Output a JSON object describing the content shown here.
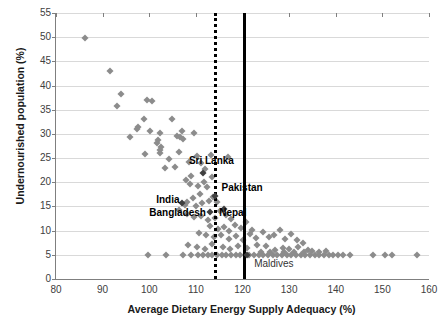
{
  "chart_data": {
    "type": "scatter",
    "title": "",
    "xlabel": "Average Dietary Energy Supply Adequacy (%)",
    "ylabel": "Undernourished population (%)",
    "xlim": [
      80,
      160
    ],
    "ylim": [
      0,
      55
    ],
    "xticks": [
      80,
      90,
      100,
      110,
      120,
      130,
      140,
      150,
      160
    ],
    "yticks": [
      0,
      5,
      10,
      15,
      20,
      25,
      30,
      35,
      40,
      45,
      50,
      55
    ],
    "grid": "horizontal",
    "legend": "none",
    "marker": "diamond",
    "marker_color": "#8c8c8c",
    "highlight_color": "#3f3f3f",
    "reference_lines": [
      {
        "name": "dotted-threshold",
        "x": 113.8,
        "style": "dotted",
        "color": "#000000"
      },
      {
        "name": "solid-threshold",
        "x": 120.2,
        "style": "solid",
        "color": "#000000"
      }
    ],
    "annotations": [
      {
        "label": "Sri Lanka",
        "x": 111.5,
        "y": 22.0,
        "label_x": 108.5,
        "label_y": 24.5
      },
      {
        "label": "Pakistan",
        "x": 114.0,
        "y": 17.2,
        "label_x": 115.5,
        "label_y": 18.8
      },
      {
        "label": "India",
        "x": 107.0,
        "y": 15.8,
        "label_x": 101.5,
        "label_y": 16.4
      },
      {
        "label": "Bangladesh",
        "x": 113.0,
        "y": 13.8,
        "label_x": 100.0,
        "label_y": 13.6
      },
      {
        "label": "Nepal",
        "x": 116.0,
        "y": 14.4,
        "label_x": 115.0,
        "label_y": 13.6
      },
      {
        "label": "Maldives",
        "x": 121.0,
        "y": 5.0,
        "label_x": 122.5,
        "label_y": 3.0
      }
    ],
    "points": [
      [
        86.2,
        49.8
      ],
      [
        91.5,
        43.1
      ],
      [
        94.0,
        38.2
      ],
      [
        93.0,
        35.7
      ],
      [
        99.6,
        37.0
      ],
      [
        100.6,
        36.8
      ],
      [
        97.3,
        31.0
      ],
      [
        97.6,
        31.4
      ],
      [
        98.9,
        33.0
      ],
      [
        95.8,
        29.3
      ],
      [
        100.2,
        30.5
      ],
      [
        102.3,
        30.2
      ],
      [
        104.9,
        33.0
      ],
      [
        101.8,
        28.8
      ],
      [
        101.6,
        28.2
      ],
      [
        102.6,
        27.2
      ],
      [
        102.4,
        26.6
      ],
      [
        102.2,
        26.0
      ],
      [
        99.0,
        25.8
      ],
      [
        106.0,
        29.5
      ],
      [
        106.6,
        29.3
      ],
      [
        107.0,
        30.5
      ],
      [
        107.3,
        29.0
      ],
      [
        109.7,
        30.1
      ],
      [
        106.3,
        26.3
      ],
      [
        104.2,
        24.8
      ],
      [
        103.4,
        23.0
      ],
      [
        105.6,
        23.2
      ],
      [
        108.5,
        24.2
      ],
      [
        110.3,
        25.4
      ],
      [
        111.0,
        24.0
      ],
      [
        112.0,
        22.8
      ],
      [
        113.2,
        25.6
      ],
      [
        116.8,
        25.3
      ],
      [
        109.0,
        21.2
      ],
      [
        107.8,
        20.4
      ],
      [
        108.8,
        19.6
      ],
      [
        110.4,
        19.2
      ],
      [
        111.7,
        20.0
      ],
      [
        112.4,
        19.0
      ],
      [
        113.5,
        21.0
      ],
      [
        110.8,
        17.6
      ],
      [
        109.4,
        16.8
      ],
      [
        108.2,
        16.0
      ],
      [
        107.6,
        15.4
      ],
      [
        110.0,
        15.0
      ],
      [
        111.4,
        15.8
      ],
      [
        112.8,
        16.2
      ],
      [
        113.6,
        17.0
      ],
      [
        114.6,
        16.0
      ],
      [
        106.4,
        14.2
      ],
      [
        108.0,
        13.4
      ],
      [
        109.6,
        12.8
      ],
      [
        111.2,
        13.0
      ],
      [
        112.6,
        12.2
      ],
      [
        114.0,
        12.6
      ],
      [
        115.2,
        14.0
      ],
      [
        116.4,
        13.2
      ],
      [
        117.6,
        12.4
      ],
      [
        113.0,
        11.0
      ],
      [
        114.8,
        10.4
      ],
      [
        116.0,
        10.8
      ],
      [
        117.2,
        10.0
      ],
      [
        118.4,
        11.2
      ],
      [
        119.6,
        10.6
      ],
      [
        120.8,
        11.8
      ],
      [
        122.0,
        10.2
      ],
      [
        110.6,
        9.6
      ],
      [
        112.2,
        9.0
      ],
      [
        113.8,
        8.6
      ],
      [
        115.4,
        9.2
      ],
      [
        117.0,
        8.2
      ],
      [
        118.6,
        8.8
      ],
      [
        120.2,
        8.0
      ],
      [
        121.6,
        9.4
      ],
      [
        123.0,
        8.4
      ],
      [
        124.4,
        9.8
      ],
      [
        125.6,
        8.6
      ],
      [
        126.8,
        9.0
      ],
      [
        128.0,
        10.2
      ],
      [
        129.2,
        8.2
      ],
      [
        130.4,
        9.4
      ],
      [
        131.6,
        8.0
      ],
      [
        133.0,
        7.4
      ],
      [
        108.4,
        7.0
      ],
      [
        110.2,
        6.6
      ],
      [
        112.0,
        6.2
      ],
      [
        113.4,
        7.2
      ],
      [
        103.6,
        5.0
      ],
      [
        99.8,
        5.0
      ],
      [
        107.2,
        5.0
      ],
      [
        109.0,
        5.0
      ],
      [
        110.5,
        5.0
      ],
      [
        111.5,
        5.0
      ],
      [
        112.5,
        5.0
      ],
      [
        113.5,
        5.0
      ],
      [
        114.5,
        5.0
      ],
      [
        115.5,
        5.0
      ],
      [
        116.5,
        5.0
      ],
      [
        117.5,
        5.0
      ],
      [
        118.5,
        5.0
      ],
      [
        119.5,
        5.0
      ],
      [
        120.5,
        5.0
      ],
      [
        121.5,
        5.0
      ],
      [
        122.5,
        5.0
      ],
      [
        123.5,
        5.0
      ],
      [
        124.5,
        5.0
      ],
      [
        125.5,
        5.0
      ],
      [
        126.5,
        5.0
      ],
      [
        127.5,
        5.0
      ],
      [
        128.5,
        5.0
      ],
      [
        129.5,
        5.0
      ],
      [
        130.5,
        5.0
      ],
      [
        131.5,
        5.0
      ],
      [
        132.5,
        5.0
      ],
      [
        133.5,
        5.0
      ],
      [
        134.5,
        5.0
      ],
      [
        135.5,
        5.0
      ],
      [
        136.5,
        5.0
      ],
      [
        137.5,
        5.0
      ],
      [
        138.5,
        5.0
      ],
      [
        139.5,
        5.0
      ],
      [
        140.5,
        5.0
      ],
      [
        141.5,
        5.0
      ],
      [
        143.0,
        5.0
      ],
      [
        148.0,
        5.0
      ],
      [
        150.5,
        5.0
      ],
      [
        152.0,
        5.0
      ],
      [
        157.5,
        5.0
      ],
      [
        127.0,
        6.0
      ],
      [
        128.6,
        6.4
      ],
      [
        130.0,
        6.2
      ],
      [
        132.0,
        6.6
      ],
      [
        134.0,
        6.0
      ],
      [
        125.0,
        6.8
      ],
      [
        123.2,
        7.0
      ],
      [
        121.0,
        6.4
      ],
      [
        119.0,
        6.8
      ],
      [
        117.4,
        6.2
      ],
      [
        115.8,
        6.6
      ],
      [
        124.0,
        5.6
      ],
      [
        126.0,
        5.6
      ],
      [
        129.0,
        5.6
      ],
      [
        131.0,
        5.6
      ],
      [
        133.2,
        5.6
      ],
      [
        135.0,
        5.8
      ],
      [
        136.5,
        5.6
      ],
      [
        138.0,
        5.8
      ]
    ]
  }
}
